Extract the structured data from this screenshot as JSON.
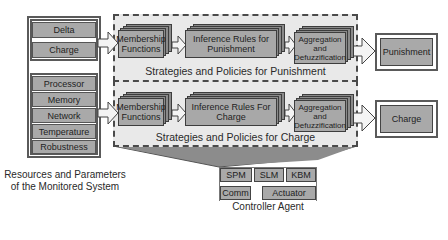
{
  "inputs": {
    "top_group": [
      "Delta",
      "Charge"
    ],
    "resource_group": [
      "Processor",
      "Memory",
      "Network",
      "Temperature",
      "Robustness"
    ],
    "caption_line1": "Resources and Parameters",
    "caption_line2": "of the Monitored System"
  },
  "punishment_pipeline": {
    "membership_line1": "Membership",
    "membership_line2": "Functions",
    "inference_line1": "Inference Rules for",
    "inference_line2": "Punishment",
    "aggregation_line1": "Aggregation",
    "aggregation_line2": "and",
    "aggregation_line3": "Defuzzification",
    "section_label": "Strategies and Policies for Punishment",
    "output": "Punishment"
  },
  "charge_pipeline": {
    "membership_line1": "Membership",
    "membership_line2": "Functions",
    "inference_line1": "Inference Rules For",
    "inference_line2": "Charge",
    "aggregation_line1": "Aggregation",
    "aggregation_line2": "and",
    "aggregation_line3": "Defuzzification",
    "section_label": "Strategies and Policies for Charge",
    "output": "Charge"
  },
  "controller_agent": {
    "modules_row1": [
      "SPM",
      "SLM",
      "KBM"
    ],
    "modules_row2": [
      "Comm",
      "Actuator"
    ],
    "label": "Controller Agent"
  },
  "colors": {
    "box_fill": "#a9a9a9",
    "stack_back": "#8a8a8a",
    "container_fill": "#e9e9e9",
    "border": "#4a4a4a"
  }
}
